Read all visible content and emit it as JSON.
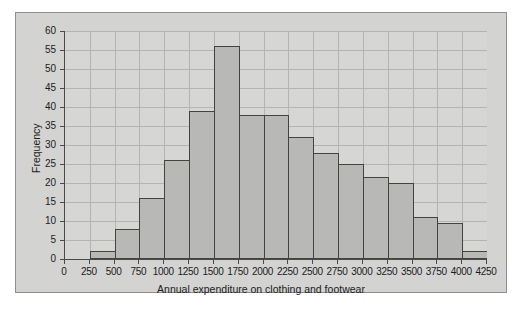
{
  "chart_data": {
    "type": "bar",
    "title": "",
    "xlabel": "Annual expenditure on clothing and footwear",
    "ylabel": "Frequency",
    "xlim": [
      0,
      4250
    ],
    "ylim": [
      0,
      60
    ],
    "grid": true,
    "legend": "none",
    "bin_width": 250,
    "x_ticks": [
      0,
      250,
      500,
      750,
      1000,
      1250,
      1500,
      1750,
      2000,
      2250,
      2500,
      2750,
      3000,
      3250,
      3500,
      3750,
      4000,
      4250
    ],
    "y_ticks": [
      0,
      5,
      10,
      15,
      20,
      25,
      30,
      35,
      40,
      45,
      50,
      55,
      60
    ],
    "categories": [
      "0-250",
      "250-500",
      "500-750",
      "750-1000",
      "1000-1250",
      "1250-1500",
      "1500-1750",
      "1750-2000",
      "2000-2250",
      "2250-2500",
      "2500-2750",
      "2750-3000",
      "3000-3250",
      "3250-3500",
      "3500-3750",
      "3750-4000",
      "4000-4250"
    ],
    "bin_starts": [
      0,
      250,
      500,
      750,
      1000,
      1250,
      1500,
      1750,
      2000,
      2250,
      2500,
      2750,
      3000,
      3250,
      3500,
      3750,
      4000
    ],
    "values": [
      0,
      2,
      8,
      16,
      26,
      39,
      56,
      38,
      38,
      32,
      28,
      25,
      21.5,
      20,
      11,
      9.5,
      2
    ]
  },
  "style": {
    "page_background": "#ffffff",
    "figure_background": "#d3d3d2",
    "plot_background": "#d6d6d5",
    "bar_fill": "#b8b8b6",
    "bar_stroke": "#44443f",
    "grid_color": "#b4b4b2",
    "axis_color": "#4a4a48",
    "text_color": "#1c1c1c"
  }
}
